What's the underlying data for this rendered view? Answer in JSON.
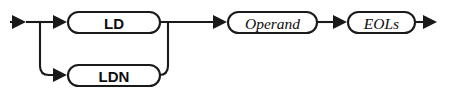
{
  "diagram": {
    "type": "railroad-syntax-diagram",
    "background_color": "#ffffff",
    "line_color": "#1a1a1a",
    "text_color": "#0d0d0d",
    "main_track_y": 22,
    "alternate_track_y": 75,
    "nodes": [
      {
        "id": "ld",
        "label": "LD",
        "kind": "terminal",
        "style": "bold-sans",
        "x": 68,
        "y": 12,
        "width": 92,
        "height": 21,
        "center_x": 114,
        "center_y": 22.5
      },
      {
        "id": "ldn",
        "label": "LDN",
        "kind": "terminal",
        "style": "bold-sans",
        "x": 68,
        "y": 65,
        "width": 92,
        "height": 21,
        "center_x": 114,
        "center_y": 75.5
      },
      {
        "id": "operand",
        "label": "Operand",
        "kind": "nonterminal",
        "style": "italic-serif",
        "x": 228,
        "y": 12,
        "width": 89,
        "height": 21,
        "center_x": 272.5,
        "center_y": 22.5
      },
      {
        "id": "eols",
        "label": "EOLs",
        "kind": "nonterminal",
        "style": "italic-serif",
        "x": 348,
        "y": 12,
        "width": 67,
        "height": 21,
        "center_x": 381.5,
        "center_y": 22.5
      }
    ],
    "arrows": [
      {
        "id": "entry-arrow",
        "tip_x": 26,
        "y": 22
      },
      {
        "id": "arrow-to-ld",
        "tip_x": 67,
        "y": 22
      },
      {
        "id": "arrow-to-ldn",
        "tip_x": 67,
        "y": 75
      },
      {
        "id": "arrow-to-operand",
        "tip_x": 227,
        "y": 22
      },
      {
        "id": "arrow-to-eols",
        "tip_x": 347,
        "y": 22
      },
      {
        "id": "exit-arrow",
        "tip_x": 437,
        "y": 22
      }
    ],
    "branch": {
      "split_x": 40,
      "merge_x": 168,
      "corner_radius": 9
    }
  }
}
